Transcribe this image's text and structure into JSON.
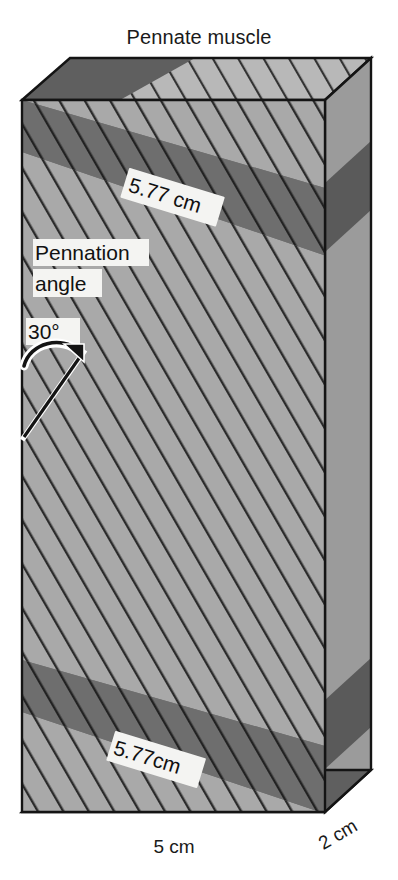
{
  "figure": {
    "title": "Pennate muscle",
    "labels": {
      "fascicle_length_top": "5.77 cm",
      "fascicle_length_bottom": "5.77cm",
      "pennation_line1": "Pennation",
      "pennation_line2": "angle",
      "pennation_value": "30°",
      "width_dimension": "5 cm",
      "depth_dimension": "2 cm"
    },
    "colors": {
      "front_face": "#a9a9a9",
      "top_face": "#b8b8b8",
      "right_face": "#9b9b9b",
      "bottom_face": "#9e9e9e",
      "band_front": "#6e6e6e",
      "band_top": "#5f5f5f",
      "band_right": "#5a5a5a",
      "fiber_stroke": "#2b2b2b",
      "outline": "#141414",
      "text": "#111111",
      "label_bg": "#f4f4f2",
      "background": "#ffffff"
    },
    "geometry": {
      "pennation_angle_degrees": 30,
      "width_cm": 5,
      "depth_cm": 2,
      "fascicle_length_cm": 5.77
    }
  }
}
